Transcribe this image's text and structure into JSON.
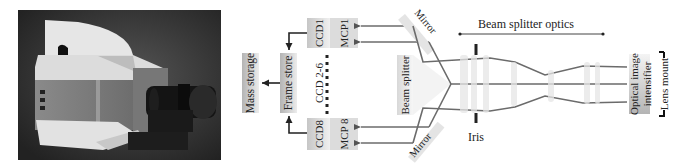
{
  "figure": {
    "photo": {
      "description": "camera-photo",
      "alt": "Photograph of framing camera housing with lens"
    },
    "storage": {
      "mass_storage": "Mass storage",
      "frame_store": "Frame store"
    },
    "detectors": {
      "ccd_top": "CCD1",
      "mcp_top": "MCP1",
      "ccd_middle": "CCD 2-6",
      "ccd_bottom": "CCD8",
      "mcp_bottom": "MCP 8"
    },
    "optics": {
      "mirror_top": "Mirror",
      "mirror_bottom": "Mirror",
      "beam_splitter": "Beam splitter",
      "beam_splitter_optics": "Beam splitter optics",
      "iris": "Iris",
      "intensifier_line1": "Optical image",
      "intensifier_line2": "intensifier",
      "lens_mount": "Lens mount"
    },
    "colors": {
      "line": "#6b6b6b",
      "arrow": "#333333",
      "box_gradient_dark": "#b8b8b8",
      "box_gradient_light": "#f2f2f2",
      "photo_bg": "#3a3a3a"
    }
  }
}
